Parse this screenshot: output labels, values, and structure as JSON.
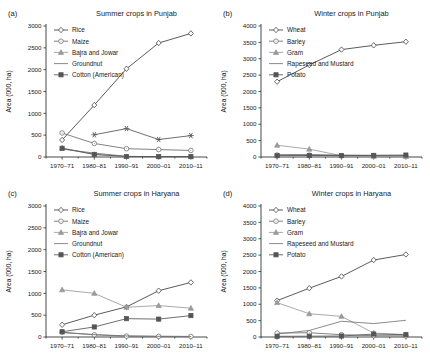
{
  "figure": {
    "width": 430,
    "height": 359,
    "shared_ylabel": "Area (000, ha)",
    "shared_xticks": [
      "1970–71",
      "1980–81",
      "1990–91",
      "2000–01",
      "2010–11"
    ],
    "colors": {
      "foreground": "#1a1a1a",
      "rice": "#3d3d3d",
      "maize": "#6b6b6b",
      "bajra_and_jowar": "#9a9a9a",
      "groundnut": "#767676",
      "cotton_american": "#555555",
      "wheat": "#3d3d3d",
      "barley": "#6b6b6b",
      "gram": "#9a9a9a",
      "rapeseed_and_mustard": "#767676",
      "potato": "#555555",
      "background": "#ffffff"
    }
  },
  "panels": [
    {
      "tag": "(a)",
      "title": "Summer crops in Punjab",
      "legend_position": "top-left"
    },
    {
      "tag": "(b)",
      "title": "Winter crops in Punjab",
      "legend_position": "top-left"
    },
    {
      "tag": "(c)",
      "title": "Summer crops in Haryana",
      "legend_position": "top-left"
    },
    {
      "tag": "(d)",
      "title": "Winter crops in Haryana",
      "legend_position": "top-left"
    }
  ],
  "chart_data": [
    {
      "type": "line",
      "panel": "(a)",
      "title": "Summer crops in Punjab",
      "xlabel": "",
      "ylabel": "Area (000, ha)",
      "categories": [
        "1970–71",
        "1980–81",
        "1990–91",
        "2000–01",
        "2010–11"
      ],
      "ylim": [
        0,
        3000
      ],
      "yticks": [
        0,
        500,
        1000,
        1500,
        2000,
        2500,
        3000
      ],
      "grid": false,
      "legend_position": "top-left",
      "series": [
        {
          "name": "Rice",
          "marker": "diamond",
          "values": [
            390,
            1190,
            2020,
            2610,
            2830
          ]
        },
        {
          "name": "Maize",
          "marker": "circle",
          "values": [
            550,
            310,
            190,
            170,
            150
          ]
        },
        {
          "name": "Bajra and Jowar",
          "marker": "triangle",
          "values": [
            205,
            55,
            10,
            8,
            8
          ]
        },
        {
          "name": "Groundnut",
          "marker": "none",
          "values": [
            180,
            90,
            15,
            6,
            4
          ]
        },
        {
          "name": "Cotton (American)",
          "marker": "square",
          "values": [
            200,
            60,
            12,
            10,
            10
          ]
        },
        {
          "name": "Cotton (American) upper",
          "marker": "star",
          "values": [
            null,
            510,
            650,
            400,
            490
          ]
        }
      ]
    },
    {
      "type": "line",
      "panel": "(b)",
      "title": "Winter crops in Punjab",
      "xlabel": "",
      "ylabel": "Area (000, ha)",
      "categories": [
        "1970–71",
        "1980–81",
        "1990–91",
        "2000–01",
        "2010–11"
      ],
      "ylim": [
        0,
        4000
      ],
      "yticks": [
        0,
        500,
        1000,
        1500,
        2000,
        2500,
        3000,
        3500,
        4000
      ],
      "grid": false,
      "legend_position": "top-left",
      "series": [
        {
          "name": "Wheat",
          "marker": "diamond",
          "values": [
            2300,
            2810,
            3280,
            3410,
            3520
          ]
        },
        {
          "name": "Barley",
          "marker": "circle",
          "values": [
            60,
            55,
            35,
            30,
            25
          ]
        },
        {
          "name": "Gram",
          "marker": "triangle",
          "values": [
            360,
            240,
            40,
            20,
            15
          ]
        },
        {
          "name": "Rapeseed and Mustard",
          "marker": "none",
          "values": [
            70,
            75,
            60,
            50,
            45
          ]
        },
        {
          "name": "Potato",
          "marker": "square",
          "values": [
            40,
            45,
            45,
            50,
            60
          ]
        }
      ]
    },
    {
      "type": "line",
      "panel": "(c)",
      "title": "Summer crops in Haryana",
      "xlabel": "",
      "ylabel": "Area (000, ha)",
      "categories": [
        "1970–71",
        "1980–81",
        "1990–91",
        "2000–01",
        "2010–11"
      ],
      "ylim": [
        0,
        3000
      ],
      "yticks": [
        0,
        500,
        1000,
        1500,
        2000,
        2500,
        3000
      ],
      "grid": false,
      "legend_position": "top-left",
      "series": [
        {
          "name": "Rice",
          "marker": "diamond",
          "values": [
            280,
            500,
            690,
            1060,
            1250
          ]
        },
        {
          "name": "Maize",
          "marker": "circle",
          "values": [
            110,
            50,
            20,
            15,
            12
          ]
        },
        {
          "name": "Bajra and Jowar",
          "marker": "triangle",
          "values": [
            1080,
            1000,
            680,
            720,
            660
          ]
        },
        {
          "name": "Groundnut",
          "marker": "none",
          "values": [
            100,
            55,
            25,
            15,
            12
          ]
        },
        {
          "name": "Cotton (American)",
          "marker": "square",
          "values": [
            120,
            230,
            420,
            410,
            490
          ]
        }
      ]
    },
    {
      "type": "line",
      "panel": "(d)",
      "title": "Winter crops in Haryana",
      "xlabel": "",
      "ylabel": "Area (000, ha)",
      "categories": [
        "1970–71",
        "1980–81",
        "1990–91",
        "2000–01",
        "2010–11"
      ],
      "ylim": [
        0,
        4000
      ],
      "yticks": [
        0,
        500,
        1000,
        1500,
        2000,
        2500,
        3000,
        3500,
        4000
      ],
      "grid": false,
      "legend_position": "top-left",
      "series": [
        {
          "name": "Wheat",
          "marker": "diamond",
          "values": [
            1110,
            1490,
            1850,
            2350,
            2520
          ]
        },
        {
          "name": "Barley",
          "marker": "circle",
          "values": [
            120,
            130,
            70,
            40,
            35
          ]
        },
        {
          "name": "Gram",
          "marker": "triangle",
          "values": [
            1050,
            710,
            630,
            120,
            75
          ]
        },
        {
          "name": "Rapeseed and Mustard",
          "marker": "none",
          "values": [
            90,
            200,
            480,
            410,
            510
          ]
        },
        {
          "name": "Potato",
          "marker": "square",
          "values": [
            20,
            25,
            30,
            90,
            70
          ]
        }
      ]
    }
  ]
}
